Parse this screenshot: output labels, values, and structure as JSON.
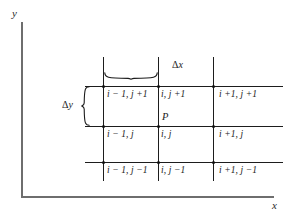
{
  "figure": {
    "name": "finite-difference-grid-stencil",
    "background_color": "#ffffff",
    "ink_color": "#1b1b1b",
    "axis_color": "#6e6e6e"
  },
  "axes": {
    "y_label": "y",
    "x_label": "x"
  },
  "annotations": {
    "delta_x": "Δx",
    "delta_x_symbol": "Δ",
    "delta_x_var": "x",
    "delta_y": "Δy",
    "delta_y_symbol": "Δ",
    "delta_y_var": "y",
    "point": "P"
  },
  "grid": {
    "rows": [
      {
        "row_name": "j-plus-1",
        "cells": [
          {
            "label": "i − 1, j +1"
          },
          {
            "label": "i, j +1"
          },
          {
            "label": "i +1, j +1"
          }
        ]
      },
      {
        "row_name": "j",
        "cells": [
          {
            "label": "i − 1, j"
          },
          {
            "label": "i, j"
          },
          {
            "label": "i +1, j"
          }
        ]
      },
      {
        "row_name": "j-minus-1",
        "cells": [
          {
            "label": "i − 1, j −1"
          },
          {
            "label": "i, j −1"
          },
          {
            "label": "i +1, j −1"
          }
        ]
      }
    ]
  }
}
